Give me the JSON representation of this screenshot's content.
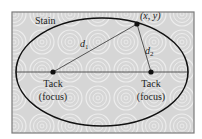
{
  "diagram": {
    "title_label": "Stain",
    "point_label": "(x, y)",
    "distance_labels": {
      "d1": {
        "main": "d",
        "sub": "1"
      },
      "d2": {
        "main": "d",
        "sub": "2"
      }
    },
    "foci": [
      {
        "line1": "Tack",
        "line2": "(focus)"
      },
      {
        "line1": "Tack",
        "line2": "(focus)"
      }
    ],
    "colors": {
      "background": "#d9d9d9",
      "pattern": "#f2f2f2",
      "border": "#7a7a7a",
      "ellipse": "#111111",
      "axis": "#555555",
      "lines": "#444444"
    }
  }
}
